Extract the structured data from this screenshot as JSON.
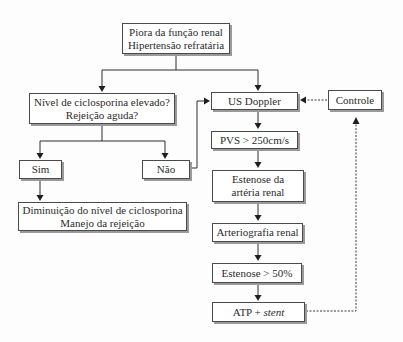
{
  "diagram": {
    "type": "flowchart",
    "nodes": {
      "start": {
        "line1": "Piora da função renal",
        "line2": "Hipertensão refratária"
      },
      "ciclosporina": {
        "line1": "Nível de ciclosporina elevado?",
        "line2": "Rejeição aguda?"
      },
      "sim": {
        "label": "Sim"
      },
      "nao": {
        "label": "Não"
      },
      "manejo": {
        "line1": "Diminuição do nível de ciclosporina",
        "line2": "Manejo da rejeição"
      },
      "doppler": {
        "label": "US Doppler"
      },
      "controle": {
        "label": "Controle"
      },
      "pvs": {
        "label": "PVS > 250cm/s"
      },
      "estenose_arteria": {
        "line1": "Estenose da",
        "line2": "artéria renal"
      },
      "arteriografia": {
        "label": "Arteriografia renal"
      },
      "estenose50": {
        "label": "Estenose > 50%"
      },
      "atp": {
        "prefix": "ATP + ",
        "italic": "stent"
      }
    },
    "edges": [
      {
        "from": "start",
        "to": "ciclosporina",
        "style": "solid"
      },
      {
        "from": "start",
        "to": "doppler",
        "style": "solid"
      },
      {
        "from": "ciclosporina",
        "to": "sim",
        "style": "solid"
      },
      {
        "from": "ciclosporina",
        "to": "nao",
        "style": "solid"
      },
      {
        "from": "sim",
        "to": "manejo",
        "style": "solid"
      },
      {
        "from": "nao",
        "to": "doppler",
        "style": "solid"
      },
      {
        "from": "doppler",
        "to": "pvs",
        "style": "solid"
      },
      {
        "from": "pvs",
        "to": "estenose_arteria",
        "style": "solid"
      },
      {
        "from": "estenose_arteria",
        "to": "arteriografia",
        "style": "solid"
      },
      {
        "from": "arteriografia",
        "to": "estenose50",
        "style": "solid"
      },
      {
        "from": "estenose50",
        "to": "atp",
        "style": "solid"
      },
      {
        "from": "atp",
        "to": "controle",
        "style": "dashed"
      },
      {
        "from": "controle",
        "to": "doppler",
        "style": "dashed"
      }
    ],
    "colors": {
      "box_border": "#4a4a4a",
      "box_shadow": "#9a9a9a",
      "line": "#2e2e2e",
      "background": "#fdfdfd"
    }
  }
}
